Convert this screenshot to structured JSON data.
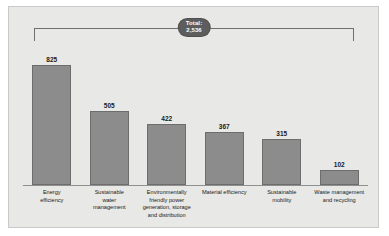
{
  "chart_data": {
    "type": "bar",
    "title": "",
    "xlabel": "",
    "ylabel": "",
    "grid": false,
    "legend": "none",
    "ylim": [
      0,
      900
    ],
    "categories": [
      "Energy efficiency",
      "Sustainable water management",
      "Environmentally friendly power generation, storage and distribution",
      "Material efficiency",
      "Sustainable mobility",
      "Waste management and recycling"
    ],
    "category_lines": [
      [
        "Energy",
        "efficiency"
      ],
      [
        "Sustainable",
        "water",
        "management"
      ],
      [
        "Environmentally",
        "friendly power",
        "generation, storage",
        "and distribution"
      ],
      [
        "Material efficiency"
      ],
      [
        "Sustainable",
        "mobility"
      ],
      [
        "Waste management",
        "and recycling"
      ]
    ],
    "values": [
      825,
      505,
      422,
      367,
      315,
      102
    ],
    "value_labels": [
      "825",
      "505",
      "422",
      "367",
      "315",
      "102"
    ],
    "annotations": {
      "total_label": "Total:",
      "total_value": "2,536"
    },
    "colors": {
      "bar_fill": "#8c8c8c",
      "bar_border": "#6d6d6d",
      "panel_background": "#e8e8e6",
      "panel_border": "#c9c9c7",
      "axis": "#8f8f8f",
      "badge_background": "#5d5d5d",
      "badge_text": "#ffffff",
      "text": "#1a1a1a"
    }
  }
}
